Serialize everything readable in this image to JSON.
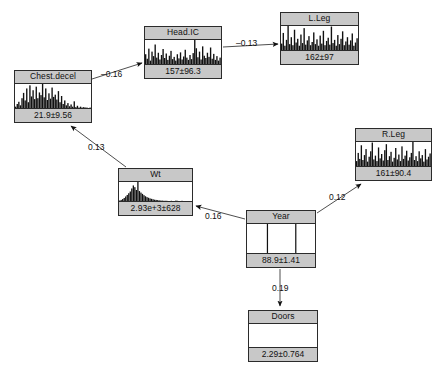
{
  "diagram": {
    "type": "bayesian-network",
    "background": "#ffffff",
    "node_header_color": "#c8c8c8",
    "node_border_color": "#2b2b2b",
    "bar_color": "#111111"
  },
  "nodes": [
    {
      "id": "chest-decel",
      "title": "Chest.decel",
      "value": "21.9±9.56",
      "x": 14,
      "y": 70,
      "w": 78,
      "h": 53,
      "bars": [
        3,
        9,
        14,
        6,
        22,
        34,
        17,
        44,
        13,
        51,
        26,
        40,
        20,
        48,
        22,
        35,
        29,
        54,
        24,
        44,
        18,
        33,
        21,
        46,
        25,
        30,
        19,
        38,
        13,
        27,
        9,
        17,
        6,
        11,
        4,
        8,
        3,
        15,
        2,
        5,
        1,
        3,
        1,
        2,
        1,
        1,
        0,
        1
      ]
    },
    {
      "id": "head-ic",
      "title": "Head.IC",
      "value": "157±96.3",
      "x": 144,
      "y": 26,
      "w": 78,
      "h": 53,
      "bars": [
        26,
        14,
        41,
        9,
        33,
        21,
        52,
        17,
        30,
        12,
        24,
        40,
        16,
        28,
        11,
        22,
        35,
        13,
        19,
        9,
        26,
        15,
        31,
        12,
        20,
        38,
        17,
        11,
        24,
        13,
        29,
        64,
        42,
        18,
        33,
        12,
        47,
        22,
        16,
        30,
        19,
        44,
        14,
        27,
        11,
        21,
        9,
        17
      ]
    },
    {
      "id": "l-leg",
      "title": "L.Leg",
      "value": "162±97",
      "x": 280,
      "y": 12,
      "w": 79,
      "h": 53,
      "bars": [
        12,
        32,
        8,
        19,
        45,
        11,
        24,
        9,
        38,
        14,
        21,
        8,
        29,
        13,
        41,
        10,
        18,
        26,
        9,
        15,
        33,
        11,
        20,
        8,
        27,
        12,
        36,
        9,
        17,
        23,
        10,
        44,
        13,
        19,
        8,
        28,
        11,
        21,
        35,
        9,
        16,
        24,
        10,
        18,
        31,
        8,
        14,
        22
      ]
    },
    {
      "id": "r-leg",
      "title": "R.Leg",
      "value": "161±90.4",
      "x": 355,
      "y": 128,
      "w": 77,
      "h": 53,
      "bars": [
        9,
        24,
        13,
        38,
        11,
        20,
        31,
        8,
        17,
        27,
        43,
        12,
        19,
        9,
        34,
        14,
        22,
        10,
        29,
        40,
        11,
        18,
        26,
        8,
        15,
        33,
        12,
        21,
        9,
        36,
        13,
        19,
        28,
        10,
        16,
        24,
        44,
        11,
        18,
        9,
        27,
        14,
        20,
        8,
        31,
        12,
        17,
        23
      ]
    },
    {
      "id": "wt",
      "title": "Wt",
      "value": "2.93e+3±628",
      "x": 118,
      "y": 168,
      "w": 75,
      "h": 48,
      "bars": [
        2,
        5,
        9,
        14,
        21,
        28,
        36,
        44,
        58,
        72,
        64,
        51,
        88,
        46,
        39,
        33,
        27,
        22,
        18,
        15,
        12,
        10,
        8,
        6,
        5,
        4,
        3,
        2,
        2,
        1,
        1,
        1,
        0,
        0,
        1,
        0,
        0,
        2,
        1,
        0,
        0,
        1,
        0,
        0,
        0,
        0,
        0,
        0
      ]
    },
    {
      "id": "year",
      "title": "Year",
      "value": "88.9±1.41",
      "x": 246,
      "y": 210,
      "w": 70,
      "h": 58,
      "bars": [
        0,
        0,
        0,
        0,
        0,
        0,
        0,
        0,
        0,
        0,
        0,
        0,
        0,
        0,
        100,
        0,
        0,
        0,
        0,
        0,
        0,
        0,
        0,
        0,
        0,
        0,
        0,
        0,
        0,
        0,
        0,
        0,
        0,
        0,
        100,
        0,
        0,
        0,
        0,
        0,
        0,
        0,
        0,
        0,
        0,
        0,
        0,
        0
      ]
    },
    {
      "id": "doors",
      "title": "Doors",
      "value": "2.29±0.764",
      "x": 248,
      "y": 310,
      "w": 70,
      "h": 52,
      "bars": [
        0,
        0,
        0,
        0,
        0,
        0,
        0,
        0,
        0,
        0,
        0,
        0,
        0,
        0,
        0,
        0,
        0,
        0,
        0,
        0,
        0,
        0,
        0,
        0,
        0,
        0,
        0,
        0,
        0,
        0,
        0,
        0,
        0,
        0,
        0,
        0,
        0,
        0,
        0,
        0,
        0,
        0,
        0,
        0,
        0,
        0,
        0,
        0
      ]
    }
  ],
  "edges": [
    {
      "id": "chest-to-head",
      "from": "chest-decel",
      "to": "head-ic",
      "label": "–0.16",
      "label_x": 101,
      "label_y": 69
    },
    {
      "id": "head-to-lleg",
      "from": "head-ic",
      "to": "l-leg",
      "label": "–0.13",
      "label_x": 236,
      "label_y": 38
    },
    {
      "id": "wt-to-chest",
      "from": "wt",
      "to": "chest-decel",
      "label": "0.13",
      "label_y": 142,
      "label_x": 88
    },
    {
      "id": "year-to-wt",
      "from": "year",
      "to": "wt",
      "label": "0.16",
      "label_x": 205,
      "label_y": 211
    },
    {
      "id": "year-to-rleg",
      "from": "year",
      "to": "r-leg",
      "label": "0.12",
      "label_x": 329,
      "label_y": 192
    },
    {
      "id": "year-to-doors",
      "from": "year",
      "to": "doors",
      "label": "0.19",
      "label_x": 272,
      "label_y": 283
    }
  ]
}
